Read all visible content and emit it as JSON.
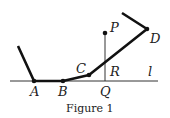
{
  "figure": {
    "caption": "Figure 1",
    "line_label": "l",
    "points": {
      "A": {
        "label": "A",
        "x": 34,
        "y": 81
      },
      "B": {
        "label": "B",
        "x": 63,
        "y": 81
      },
      "C": {
        "label": "C",
        "x": 89,
        "y": 75
      },
      "D": {
        "label": "D",
        "x": 147,
        "y": 29
      },
      "P": {
        "label": "P",
        "x": 105,
        "y": 33
      },
      "Q": {
        "label": "Q",
        "x": 105,
        "y": 81
      },
      "R": {
        "label": "R",
        "x": 105,
        "y": 63
      }
    },
    "colors": {
      "stroke": "#111111",
      "thin": "#333333"
    }
  }
}
